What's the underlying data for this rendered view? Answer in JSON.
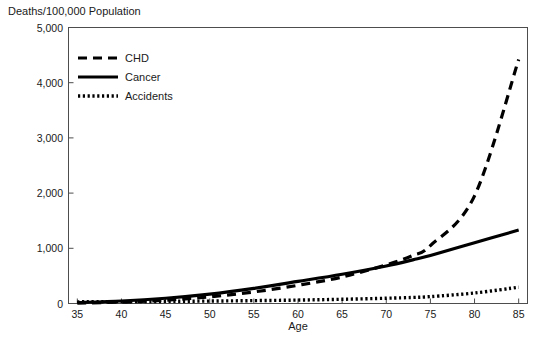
{
  "chart_data": {
    "type": "line",
    "title": "Deaths/100,000 Population",
    "xlabel": "Age",
    "ylabel": "",
    "xlim": [
      34,
      86
    ],
    "ylim": [
      0,
      5000
    ],
    "grid": false,
    "legend_position": "top-left",
    "x_ticks": [
      35,
      40,
      45,
      50,
      55,
      60,
      65,
      70,
      75,
      80,
      85
    ],
    "x_tick_labels": [
      "35",
      "40",
      "45",
      "50",
      "55",
      "60",
      "65",
      "70",
      "75",
      "80",
      "85"
    ],
    "y_ticks": [
      0,
      1000,
      2000,
      3000,
      4000,
      5000
    ],
    "y_tick_labels": [
      "0",
      "1,000",
      "2,000",
      "3,000",
      "4,000",
      "5,000"
    ],
    "x": [
      35,
      40,
      45,
      50,
      55,
      60,
      65,
      70,
      73,
      75,
      80,
      85
    ],
    "series": [
      {
        "name": "CHD",
        "style": "dashed",
        "dash": "9,6",
        "width": 3.2,
        "values": [
          8,
          25,
          60,
          120,
          210,
          330,
          480,
          700,
          870,
          1050,
          1950,
          4420
        ]
      },
      {
        "name": "Cancer",
        "style": "solid",
        "dash": "none",
        "width": 3.2,
        "values": [
          18,
          45,
          95,
          170,
          275,
          400,
          530,
          680,
          790,
          870,
          1100,
          1330
        ]
      },
      {
        "name": "Accidents",
        "style": "dotted",
        "dash": "2.2,2.6",
        "width": 3.4,
        "values": [
          30,
          34,
          38,
          44,
          52,
          62,
          76,
          95,
          110,
          125,
          190,
          295
        ]
      }
    ]
  },
  "legend": {
    "entries": [
      {
        "label": "CHD"
      },
      {
        "label": "Cancer"
      },
      {
        "label": "Accidents"
      }
    ]
  }
}
